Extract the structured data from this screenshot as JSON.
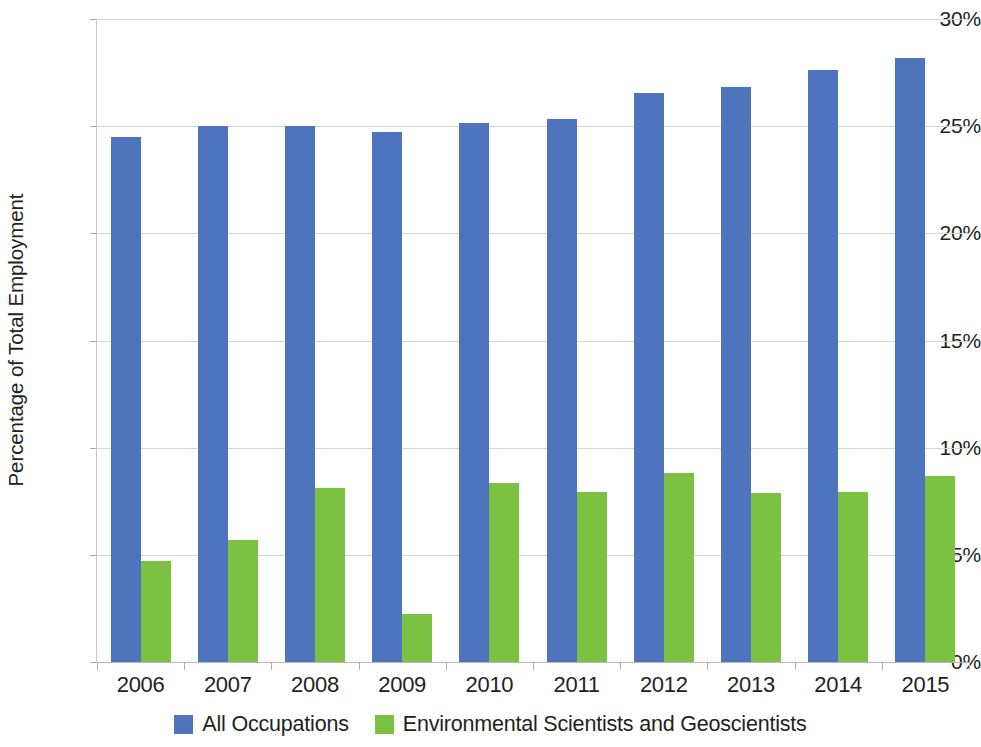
{
  "chart_data": {
    "type": "bar",
    "title": "",
    "subtitle": "",
    "xlabel": "",
    "ylabel": "Percentage of Total Employment",
    "categories": [
      "2006",
      "2007",
      "2008",
      "2009",
      "2010",
      "2011",
      "2012",
      "2013",
      "2014",
      "2015"
    ],
    "series": [
      {
        "name": "All Occupations",
        "color": "#4e74be",
        "values": [
          24.5,
          25.0,
          25.0,
          24.75,
          25.15,
          25.35,
          26.55,
          26.85,
          27.6,
          28.2
        ]
      },
      {
        "name": "Environmental Scientists and Geoscientists",
        "color": "#7cc142",
        "values": [
          4.7,
          5.7,
          8.1,
          2.25,
          8.35,
          7.95,
          8.8,
          7.9,
          7.95,
          8.7
        ]
      }
    ],
    "ylim": [
      0,
      30
    ],
    "y_ticks": [
      0,
      5,
      10,
      15,
      20,
      25,
      30
    ],
    "y_tick_labels": [
      "0%",
      "5%",
      "10%",
      "15%",
      "20%",
      "25%",
      "30%"
    ],
    "grid": true,
    "grid_axis": "y",
    "legend_position": "bottom",
    "bar_mode": "grouped"
  },
  "axes": {
    "y_title": "Percentage of Total Employment"
  },
  "legend": {
    "items": [
      {
        "label": "All Occupations",
        "color": "#4e74be"
      },
      {
        "label": "Environmental Scientists and Geoscientists",
        "color": "#7cc142"
      }
    ]
  },
  "colors": {
    "series_blue": "#4e74be",
    "series_green": "#7cc142",
    "gridline": "#d4d4d4",
    "axis": "#c9c9c9",
    "text": "#231f20",
    "background": "#ffffff"
  }
}
